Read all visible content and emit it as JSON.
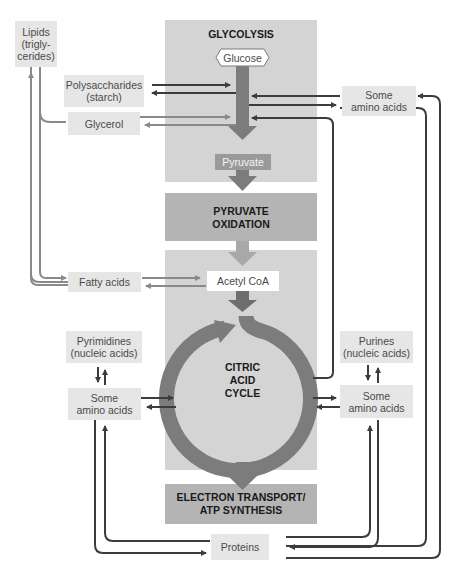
{
  "stages": {
    "glycolysis": "GLYCOLYSIS",
    "pyruvate_oxidation_1": "PYRUVATE",
    "pyruvate_oxidation_2": "OXIDATION",
    "citric_1": "CITRIC",
    "citric_2": "ACID",
    "citric_3": "CYCLE",
    "etc_1": "ELECTRON TRANSPORT/",
    "etc_2": "ATP SYNTHESIS"
  },
  "molecules": {
    "glucose": "Glucose",
    "pyruvate": "Pyruvate",
    "acetyl_coa": "Acetyl CoA",
    "lipids_1": "Lipids",
    "lipids_2": "(trigly-",
    "lipids_3": "cerides)",
    "polysaccharides_1": "Polysaccharides",
    "polysaccharides_2": "(starch)",
    "glycerol": "Glycerol",
    "fatty_acids": "Fatty acids",
    "amino_top_1": "Some",
    "amino_top_2": "amino acids",
    "pyrimidines_1": "Pyrimidines",
    "pyrimidines_2": "(nucleic acids)",
    "amino_left_1": "Some",
    "amino_left_2": "amino acids",
    "purines_1": "Purines",
    "purines_2": "(nucleic acids)",
    "amino_right_1": "Some",
    "amino_right_2": "amino acids",
    "proteins": "Proteins"
  },
  "colors": {
    "stage_light": "#d4d4d4",
    "stage_dark": "#b4b4b4",
    "main_arrow": "#7c7c7c",
    "lipid_arrow": "#8a8a8a",
    "dark_arrow": "#3c3c3c",
    "box_light": "#e6e6e6"
  }
}
